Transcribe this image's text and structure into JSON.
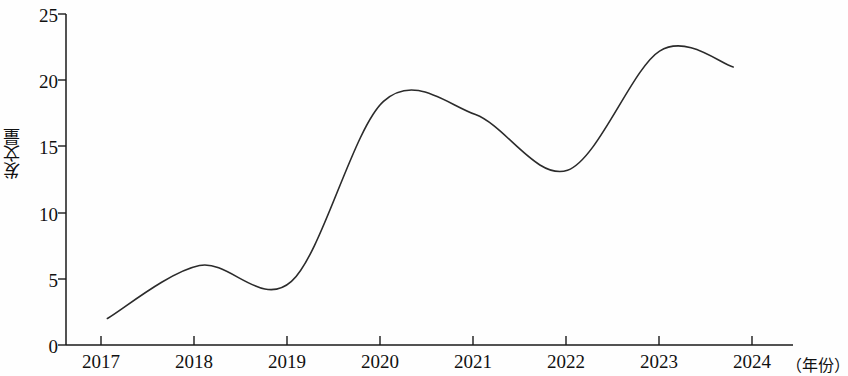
{
  "chart_data": {
    "type": "line",
    "title": "",
    "subtitle": "",
    "xlabel": "（年份）",
    "ylabel": "发文量",
    "x": [
      2017,
      2018,
      2019,
      2020,
      2021,
      2022,
      2023,
      2023.8
    ],
    "values": [
      2.0,
      6.0,
      4.8,
      18.4,
      17.4,
      13.2,
      22.2,
      21.0
    ],
    "series": [
      {
        "name": "发文量",
        "values": [
          2.0,
          6.0,
          4.8,
          18.4,
          17.4,
          13.2,
          22.2,
          21.0
        ]
      }
    ],
    "xlim": [
      2016.55,
      2024.45
    ],
    "ylim": [
      0,
      25
    ],
    "xticks": [
      2017,
      2018,
      2019,
      2020,
      2021,
      2022,
      2023,
      2024
    ],
    "xtick_labels": [
      "2017",
      "2018",
      "2019",
      "2020",
      "2021",
      "2022",
      "2023",
      "2024"
    ],
    "yticks": [
      0,
      5,
      10,
      15,
      20,
      25
    ],
    "ytick_labels": [
      "0",
      "5",
      "10",
      "15",
      "20",
      "25"
    ],
    "grid": false,
    "legend": false,
    "line_color": "#2b2b2b",
    "line_width": 1.6,
    "axis_color": "#1a1a1a",
    "background": "#fefefe"
  },
  "axis": {
    "y_title": "发文量",
    "x_unit": "（年份）"
  }
}
